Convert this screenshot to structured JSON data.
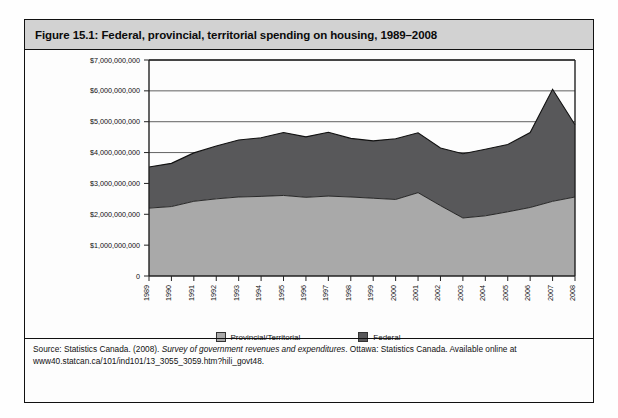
{
  "figure": {
    "title": "Figure 15.1: Federal, provincial, territorial spending on housing, 1989–2008",
    "source_prefix": "Source: Statistics Canada. (2008). ",
    "source_italic": "Survey of government revenues and expenditures",
    "source_suffix": ". Ottawa: Statistics Canada. Available online at www40.statcan.ca/101/ind101/13_3055_3059.htm?hili_govt48."
  },
  "legend": {
    "position": "bottom-center",
    "items": [
      {
        "label": "Provincial/Territorial",
        "color": "#a9a9a9"
      },
      {
        "label": "Federal",
        "color": "#58585a"
      }
    ]
  },
  "colors": {
    "provincial": "#a9a9a9",
    "federal": "#58585a",
    "header_band": "#d2d2d2",
    "border": "#111111"
  },
  "chart_data": {
    "type": "area",
    "stacked": true,
    "title": "Federal, provincial, territorial spending on housing, 1989–2008",
    "xlabel": "",
    "ylabel": "",
    "grid": true,
    "ylim": [
      0,
      7000000000
    ],
    "ytick_labels": [
      "$7,000,000,000",
      "$6,000,000,000",
      "$5,000,000,000",
      "$4,000,000,000",
      "$3,000,000,000",
      "$2,000,000,000",
      "$1,000,000,000",
      "0"
    ],
    "ytick_values": [
      7000000000,
      6000000000,
      5000000000,
      4000000000,
      3000000000,
      2000000000,
      1000000000,
      0
    ],
    "categories": [
      "1989",
      "1990",
      "1991",
      "1992",
      "1993",
      "1994",
      "1995",
      "1996",
      "1997",
      "1998",
      "1999",
      "2000",
      "2001",
      "2002",
      "2003",
      "2004",
      "2005",
      "2006",
      "2007",
      "2008"
    ],
    "series": [
      {
        "name": "Provincial/Territorial",
        "color": "#a9a9a9",
        "values": [
          2200000000,
          2250000000,
          2420000000,
          2500000000,
          2560000000,
          2580000000,
          2610000000,
          2550000000,
          2590000000,
          2560000000,
          2520000000,
          2480000000,
          2700000000,
          2280000000,
          1880000000,
          1950000000,
          2080000000,
          2220000000,
          2420000000,
          2560000000
        ]
      },
      {
        "name": "Federal",
        "color": "#58585a",
        "values": [
          1330000000,
          1400000000,
          1570000000,
          1710000000,
          1850000000,
          1900000000,
          2040000000,
          1960000000,
          2070000000,
          1900000000,
          1860000000,
          1970000000,
          1940000000,
          1870000000,
          2080000000,
          2160000000,
          2180000000,
          2430000000,
          3630000000,
          2340000000
        ]
      }
    ],
    "totals": [
      3530000000,
      3650000000,
      3990000000,
      4210000000,
      4410000000,
      4480000000,
      4650000000,
      4510000000,
      4660000000,
      4460000000,
      4380000000,
      4450000000,
      4640000000,
      4150000000,
      3960000000,
      4110000000,
      4260000000,
      4650000000,
      6050000000,
      4900000000
    ]
  }
}
